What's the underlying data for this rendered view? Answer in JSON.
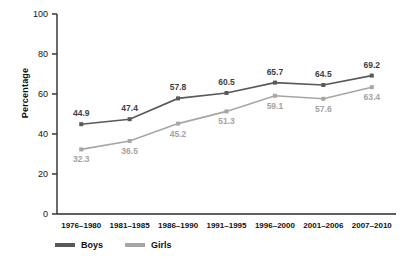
{
  "chart_data": {
    "type": "line",
    "title": "",
    "xlabel": "",
    "ylabel": "Percentage",
    "ylim": [
      0,
      100
    ],
    "yticks": [
      0,
      20,
      40,
      60,
      80,
      100
    ],
    "grid": false,
    "legend_position": "bottom-left",
    "categories": [
      "1976–1980",
      "1981–1985",
      "1986–1990",
      "1991–1995",
      "1996–2000",
      "2001–2006",
      "2007–2010"
    ],
    "series": [
      {
        "name": "Boys",
        "color": "#595959",
        "label_position": "above",
        "values": [
          44.9,
          47.4,
          57.8,
          60.5,
          65.7,
          64.5,
          69.2
        ],
        "value_labels": [
          "44.9",
          "47.4",
          "57.8",
          "60.5",
          "65.7",
          "64.5",
          "69.2"
        ]
      },
      {
        "name": "Girls",
        "color": "#a6a6a6",
        "label_position": "below",
        "values": [
          32.3,
          36.5,
          45.2,
          51.3,
          59.1,
          57.6,
          63.4
        ],
        "value_labels": [
          "32.3",
          "36.5",
          "45.2",
          "51.3",
          "59.1",
          "57.6",
          "63.4"
        ]
      }
    ]
  },
  "legend": {
    "items": [
      {
        "label": "Boys",
        "color": "#595959"
      },
      {
        "label": "Girls",
        "color": "#a6a6a6"
      }
    ]
  },
  "axis": {
    "ylabel": "Percentage",
    "ytick_labels": [
      "100",
      "80",
      "60",
      "40",
      "20",
      "0"
    ]
  }
}
